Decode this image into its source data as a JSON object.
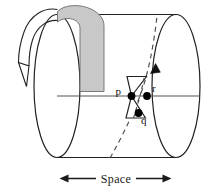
{
  "figure": {
    "background_color": "#ffffff",
    "line_color": "#222222",
    "shaded_band_color": "#c8c8c8",
    "shaded_band_stroke": "#6e6e6e",
    "dot_color": "#000000",
    "dashed_color": "#555555"
  },
  "cylinder": {
    "name": "spacetime-cylinder",
    "left_cap_label": "",
    "right_cap_label": ""
  },
  "rotation_arrow": {
    "name": "rotation-arrow",
    "label": "",
    "direction": "counterclockwise-over-top"
  },
  "shaded_band": {
    "name": "shaded-time-band",
    "label": ""
  },
  "worldline": {
    "name": "dashed-worldline",
    "label": "",
    "style": "dashed",
    "arrowhead": "up"
  },
  "light_cone": {
    "name": "light-cone",
    "label": "",
    "shape": "double-cone"
  },
  "points": [
    {
      "id": "p",
      "label": "p",
      "cx": 131.5,
      "cy": 96.0,
      "label_x": 122.5,
      "label_y": 94.0
    },
    {
      "id": "r",
      "label": "r",
      "cx": 147.0,
      "cy": 96.0,
      "label_x": 152.0,
      "label_y": 92.0
    },
    {
      "id": "q",
      "label": "q",
      "cx": 138.5,
      "cy": 113.0,
      "label_x": 141.0,
      "label_y": 123.0
    }
  ],
  "space_axis": {
    "name": "space-axis",
    "label": "Space",
    "arrow_left": "◀",
    "arrow_right": "▶"
  }
}
